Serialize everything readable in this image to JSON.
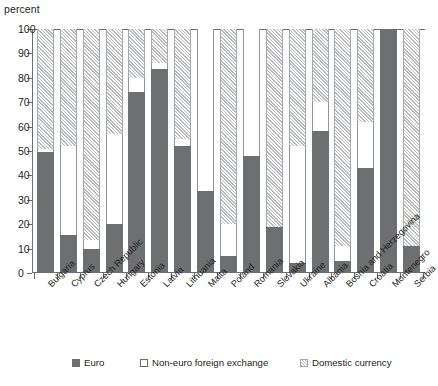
{
  "chart_data": {
    "type": "bar",
    "subtype": "stacked-100-percent",
    "title": "",
    "xlabel": "",
    "ylabel": "percent",
    "ylim": [
      0,
      100
    ],
    "yticks": [
      0,
      10,
      20,
      30,
      40,
      50,
      60,
      70,
      80,
      90,
      100
    ],
    "grid": false,
    "legend_position": "bottom",
    "categories": [
      "Bulgaria",
      "Cyprus",
      "Czech Republic",
      "Hungary",
      "Estonia",
      "Latvia",
      "Lithuania",
      "Malta",
      "Poland",
      "Romania",
      "Slovakia",
      "Ukraine",
      "Albania",
      "Bosnia and Herzegovina",
      "Croatia",
      "Montenegro",
      "Serbia"
    ],
    "series": [
      {
        "name": "Euro",
        "color": "#6e6f71",
        "values": [
          49.5,
          15.5,
          10,
          20,
          74,
          83.5,
          52,
          33.5,
          7,
          48,
          19,
          4,
          58,
          5,
          43,
          100,
          11
        ]
      },
      {
        "name": "Non-euro foreign exchange",
        "color": "#ffffff",
        "values": [
          1.5,
          36.5,
          3.5,
          37,
          6,
          2.5,
          3,
          66.5,
          13,
          52,
          0,
          48,
          12,
          6,
          19,
          0,
          0
        ]
      },
      {
        "name": "Domestic currency",
        "color": "#b9babc",
        "values": [
          49,
          48,
          86.5,
          43,
          20,
          14,
          45,
          0,
          80,
          0,
          81,
          48,
          30,
          89,
          38,
          0,
          89
        ]
      }
    ]
  },
  "legend": {
    "items": [
      {
        "label": "Euro",
        "swatch": "euro-swatch"
      },
      {
        "label": "Non-euro foreign exchange",
        "swatch": "nonfx-swatch"
      },
      {
        "label": "Domestic currency",
        "swatch": "domestic-swatch"
      }
    ]
  }
}
